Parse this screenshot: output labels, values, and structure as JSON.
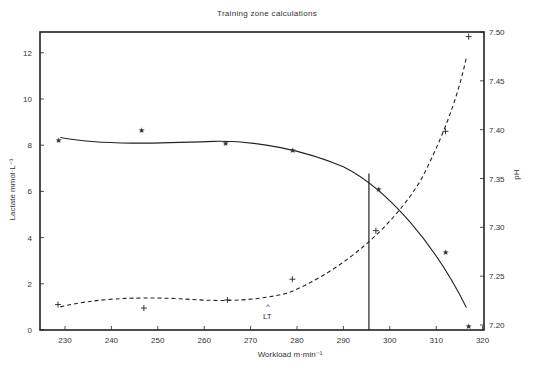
{
  "chart_data": {
    "type": "line",
    "title": "Training zone calculations",
    "xlabel": "Workload m·min⁻¹",
    "ylabel": "Lactate mmol·L⁻¹",
    "y2label": "pH",
    "xlim": [
      225,
      320
    ],
    "ylim": [
      0,
      13
    ],
    "y2lim": [
      7.2,
      7.5
    ],
    "xticks": [
      230,
      240,
      250,
      260,
      270,
      280,
      290,
      300,
      310,
      320
    ],
    "yticks": [
      0,
      2,
      4,
      6,
      8,
      10,
      12
    ],
    "y2ticks": [
      "7.20",
      "7.25",
      "7.30",
      "7.35",
      "7.40",
      "7.45",
      "7.50"
    ],
    "grid": false,
    "series": [
      {
        "name": "Lactate",
        "axis": "left",
        "marker": "+",
        "line_style": "dashed",
        "x": [
          228.5,
          247,
          265,
          279,
          297,
          312,
          317
        ],
        "values": [
          1.1,
          0.95,
          1.3,
          2.2,
          4.3,
          8.6,
          12.7
        ]
      },
      {
        "name": "pH",
        "axis": "right",
        "marker": "★",
        "line_style": "solid",
        "x": [
          228.5,
          246.5,
          264.5,
          279,
          297.5,
          312,
          317
        ],
        "values": [
          7.39,
          7.4,
          7.387,
          7.38,
          7.34,
          7.275,
          7.2
        ]
      }
    ],
    "annotations": [
      {
        "text": "LT",
        "x": 268,
        "marker": "^"
      },
      {
        "type": "vertical_line",
        "x": 295.5,
        "from_y": 0,
        "to_curve": "pH"
      }
    ]
  },
  "labels": {
    "title": "Training zone calculations",
    "xlabel": "Workload m·min⁻¹",
    "ylabel": "Lactate mmol·L⁻¹",
    "y2label": "pH",
    "lt": "LT",
    "lt_caret": "^"
  }
}
